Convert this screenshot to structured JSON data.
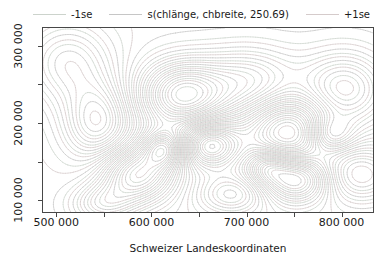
{
  "chart_data": {
    "type": "contour",
    "title": "s(chlänge, chbreite, 250.69)",
    "xlabel": "Schweizer Landeskoordinaten",
    "ylabel": "",
    "xlim": [
      486000,
      833000
    ],
    "ylim": [
      85000,
      323000
    ],
    "x_ticks_major": [
      500000,
      600000,
      700000,
      800000
    ],
    "x_tick_labels": [
      "500 000",
      "600 000",
      "700 000",
      "800 000"
    ],
    "x_ticks_minor": [
      550000,
      650000,
      750000
    ],
    "y_ticks_major": [
      100000,
      200000,
      300000
    ],
    "y_tick_labels": [
      "100 000",
      "200 000",
      "300 000"
    ],
    "y_ticks_minor": [
      150000,
      250000
    ],
    "grid": false,
    "legend_position": "top",
    "legend": [
      {
        "label": "-1se",
        "color": "#ccd3cc"
      },
      {
        "label": "s(chlänge, chbreite, 250.69)",
        "color": "#c6c6c6"
      },
      {
        "label": "+1se",
        "color": "#d5cbcb"
      }
    ],
    "surface_approximation": {
      "note": "sum-of-gaussian approximation of the plotted smooth, Swiss coord units",
      "bumps": [
        {
          "x": 585300,
          "y": 133700,
          "sx": 27200,
          "sy": 25600,
          "a": 1.0
        },
        {
          "x": 543500,
          "y": 201400,
          "sx": 25100,
          "sy": 35800,
          "a": -0.7
        },
        {
          "x": 632300,
          "y": 236000,
          "sx": 31400,
          "sy": 30700,
          "a": 1.1
        },
        {
          "x": 661600,
          "y": 172000,
          "sx": 20900,
          "sy": 20500,
          "a": -0.9
        },
        {
          "x": 613500,
          "y": 166900,
          "sx": 15700,
          "sy": 16600,
          "a": 0.85
        },
        {
          "x": 703400,
          "y": 252600,
          "sx": 35500,
          "sy": 30700,
          "a": 0.6
        },
        {
          "x": 745200,
          "y": 188700,
          "sx": 29300,
          "sy": 30700,
          "a": -0.85
        },
        {
          "x": 752500,
          "y": 128500,
          "sx": 25100,
          "sy": 21800,
          "a": 0.9
        },
        {
          "x": 802700,
          "y": 243700,
          "sx": 31400,
          "sy": 33300,
          "a": 0.7
        },
        {
          "x": 818400,
          "y": 133700,
          "sx": 29300,
          "sy": 25600,
          "a": -0.6
        },
        {
          "x": 512100,
          "y": 278200,
          "sx": 31400,
          "sy": 35800,
          "a": -0.5
        },
        {
          "x": 684600,
          "y": 108000,
          "sx": 25100,
          "sy": 17900,
          "a": -0.5
        },
        {
          "x": 788100,
          "y": 184800,
          "sx": 16700,
          "sy": 16600,
          "a": 0.55
        },
        {
          "x": 548700,
          "y": 95300,
          "sx": 23000,
          "sy": 17900,
          "a": 0.5
        },
        {
          "x": 721200,
          "y": 143900,
          "sx": 14600,
          "sy": 15400,
          "a": 0.45
        }
      ],
      "levels": [
        -0.98,
        -0.81,
        -0.64,
        -0.47,
        -0.3,
        -0.13,
        0.04,
        0.21,
        0.38,
        0.55,
        0.72,
        0.89,
        1.06
      ],
      "se_offset": 0.06
    }
  }
}
